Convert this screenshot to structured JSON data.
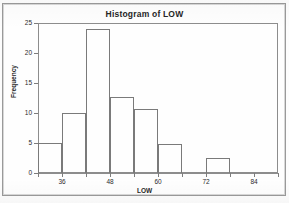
{
  "chart_data": {
    "type": "bar",
    "title": "Histogram of LOW",
    "xlabel": "LOW",
    "ylabel": "Frequency",
    "xlim": [
      30,
      90
    ],
    "ylim": [
      0,
      25
    ],
    "grid": false,
    "legend": null,
    "bin_width": 6,
    "x_ticks": [
      36,
      48,
      60,
      72,
      84
    ],
    "x_tick_labels": [
      "36",
      "48",
      "60",
      "72",
      "84"
    ],
    "x_minor_ticks": [
      30,
      42,
      54,
      66,
      78,
      90
    ],
    "y_ticks": [
      0,
      5,
      10,
      15,
      20,
      25
    ],
    "y_tick_labels": [
      "0",
      "5",
      "10",
      "15",
      "20",
      "25"
    ],
    "categories": [
      "30-36",
      "36-42",
      "42-48",
      "48-54",
      "54-60",
      "60-66",
      "66-72",
      "72-78"
    ],
    "bin_edges": [
      30,
      36,
      42,
      48,
      54,
      60,
      66,
      72,
      78
    ],
    "values": [
      5,
      10,
      24,
      12.7,
      10.6,
      4.9,
      0,
      2.5
    ]
  },
  "bars": [
    {
      "label": "30-36",
      "start": 30,
      "end": 36,
      "value": 5
    },
    {
      "label": "36-42",
      "start": 36,
      "end": 42,
      "value": 10
    },
    {
      "label": "42-48",
      "start": 42,
      "end": 48,
      "value": 24
    },
    {
      "label": "48-54",
      "start": 48,
      "end": 54,
      "value": 12.7
    },
    {
      "label": "54-60",
      "start": 54,
      "end": 60,
      "value": 10.6
    },
    {
      "label": "60-66",
      "start": 60,
      "end": 66,
      "value": 4.9
    },
    {
      "label": "72-78",
      "start": 72,
      "end": 78,
      "value": 2.5
    }
  ],
  "axes": {
    "y_labels": [
      "25",
      "20",
      "15",
      "10",
      "5",
      "0"
    ],
    "x_labels": [
      "36",
      "48",
      "60",
      "72",
      "84"
    ],
    "y_title": "Frequency",
    "x_title": "LOW"
  },
  "header": {
    "title": "Histogram of LOW"
  }
}
